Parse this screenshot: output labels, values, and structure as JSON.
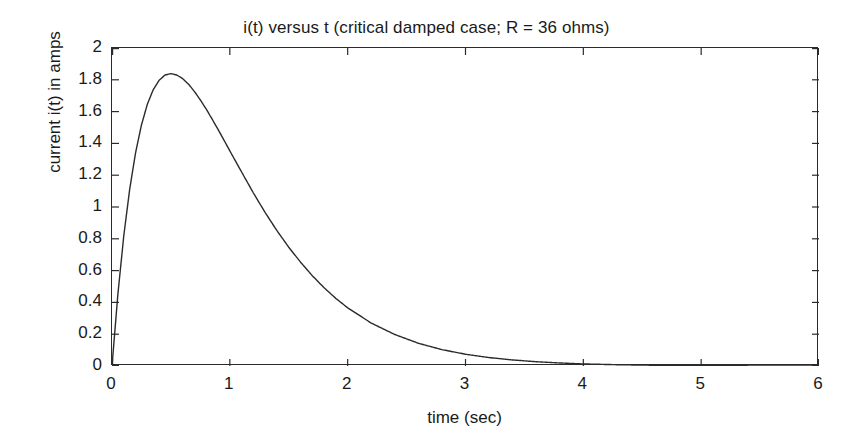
{
  "chart_data": {
    "type": "line",
    "title": "i(t) versus t (critical damped case; R = 36 ohms)",
    "xlabel": "time (sec)",
    "ylabel": "current i(t) in amps",
    "xlim": [
      0,
      6
    ],
    "ylim": [
      0,
      2
    ],
    "grid": false,
    "legend": null,
    "xticks": [
      0,
      1,
      2,
      3,
      4,
      5,
      6
    ],
    "xtick_labels": [
      "0",
      "1",
      "2",
      "3",
      "4",
      "5",
      "6"
    ],
    "yticks": [
      0,
      0.2,
      0.4,
      0.6,
      0.8,
      1,
      1.2,
      1.4,
      1.6,
      1.8,
      2
    ],
    "ytick_labels": [
      "0",
      "0.2",
      "0.4",
      "0.6",
      "0.8",
      "1",
      "1.2",
      "1.4",
      "1.6",
      "1.8",
      "2"
    ],
    "line_color": "#2b2b2b",
    "line_width": 1.4,
    "series": [
      {
        "name": "i(t)",
        "formula": "i(t) = 10*t*exp(-2*t)",
        "peak_t": 0.5,
        "peak_value": 1.839,
        "x": [
          0,
          0.05,
          0.1,
          0.15,
          0.2,
          0.25,
          0.3,
          0.35,
          0.4,
          0.45,
          0.5,
          0.55,
          0.6,
          0.65,
          0.7,
          0.75,
          0.8,
          0.85,
          0.9,
          0.95,
          1,
          1.1,
          1.2,
          1.3,
          1.4,
          1.5,
          1.6,
          1.7,
          1.8,
          1.9,
          2,
          2.2,
          2.4,
          2.6,
          2.8,
          3,
          3.2,
          3.4,
          3.6,
          3.8,
          4,
          4.25,
          4.5,
          4.75,
          5,
          5.25,
          5.5,
          5.75,
          6
        ],
        "y": [
          0,
          0.452,
          0.819,
          1.111,
          1.341,
          1.516,
          1.646,
          1.738,
          1.797,
          1.83,
          1.839,
          1.83,
          1.807,
          1.772,
          1.726,
          1.673,
          1.615,
          1.552,
          1.488,
          1.421,
          1.353,
          1.22,
          1.088,
          0.965,
          0.851,
          0.747,
          0.653,
          0.568,
          0.492,
          0.425,
          0.366,
          0.27,
          0.198,
          0.143,
          0.103,
          0.074,
          0.053,
          0.038,
          0.027,
          0.019,
          0.013,
          0.0087,
          0.0056,
          0.0036,
          0.0023,
          0.0014,
          0.0009,
          0.0006,
          0.0004
        ]
      }
    ]
  },
  "chart": {
    "title": "i(t) versus t (critical damped case; R = 36 ohms)",
    "xlabel": "time (sec)",
    "ylabel": "current i(t) in amps"
  }
}
